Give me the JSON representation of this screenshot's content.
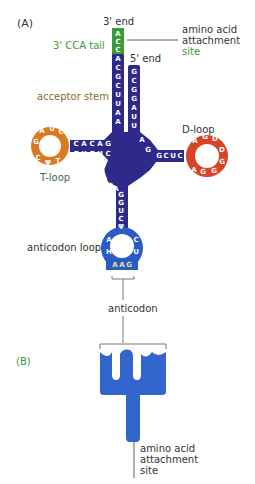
{
  "panel_a": {
    "label": "(A)",
    "three_prime_end": "3' end",
    "five_prime_end": "5' end",
    "cca_tail": "3' CCA tail",
    "amino_acid_site": [
      "amino acid",
      "attachment",
      "site"
    ],
    "acceptor_stem": "acceptor stem",
    "t_loop": "T-loop",
    "d_loop": "D-loop",
    "anticodon_loop": "anticodon loop",
    "anticodon": "anticodon",
    "sequences": {
      "cca_tail": [
        "A",
        "C",
        "C"
      ],
      "acceptor_3prime_strand": [
        "A",
        "C",
        "G",
        "C",
        "U",
        "U",
        "A",
        "A"
      ],
      "acceptor_5prime_strand": [
        "G",
        "C",
        "G",
        "G",
        "A",
        "U",
        "U"
      ],
      "t_stem_top": [
        "C",
        "A",
        "C",
        "A",
        "G"
      ],
      "t_stem_bottom": [
        "G",
        "U",
        "G",
        "U",
        "C"
      ],
      "t_loop": [
        "A",
        "U",
        "C",
        "G",
        "C",
        "Ψ",
        "T"
      ],
      "d_stem_top": [
        "G",
        "C",
        "U",
        "C"
      ],
      "d_stem_bottom": [
        "C",
        "G",
        "A",
        "G"
      ],
      "d_loop": [
        "A",
        "G",
        "D",
        "D",
        "G",
        "G",
        "A"
      ],
      "variable": [
        "C",
        "U",
        "G",
        "G",
        "A"
      ],
      "anticodon_stem_left": [
        "G",
        "G",
        "U",
        "C",
        "Ψ"
      ],
      "anticodon_stem_right": [
        "C",
        "C",
        "A",
        "G",
        "A"
      ],
      "anticodon_loop": [
        "A",
        "H",
        "C",
        "U"
      ],
      "anticodon_bases": [
        "A",
        "A",
        "G"
      ]
    },
    "colors": {
      "stem": "#2e2a8c",
      "cca": "#3a9a3a",
      "t_loop": "#d97a20",
      "d_loop": "#d8442a",
      "anticodon_loop": "#2a5cc8",
      "anticodon_text": "#e8e080"
    }
  },
  "panel_b": {
    "label": "(B)",
    "amino_acid_site": [
      "amino acid",
      "attachment",
      "site"
    ],
    "shape_color": "#3366cc"
  }
}
